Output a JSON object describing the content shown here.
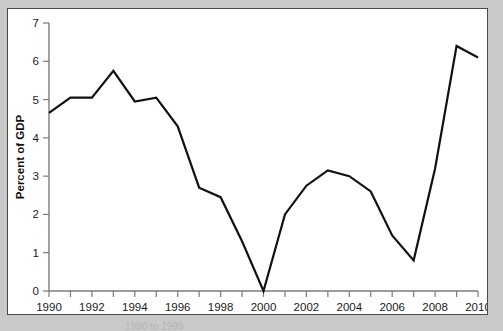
{
  "chart_data": {
    "type": "line",
    "title": "",
    "xlabel": "",
    "ylabel": "Percent of GDP",
    "xlim": [
      1990,
      2010
    ],
    "ylim": [
      0,
      7
    ],
    "grid": false,
    "legend": null,
    "x": [
      1990,
      1991,
      1992,
      1993,
      1994,
      1995,
      1996,
      1997,
      1998,
      1999,
      2000,
      2001,
      2002,
      2003,
      2004,
      2005,
      2006,
      2007,
      2008,
      2009,
      2010
    ],
    "values": [
      4.65,
      5.05,
      5.05,
      5.75,
      4.95,
      5.05,
      4.3,
      2.7,
      2.45,
      1.3,
      0.0,
      2.0,
      2.75,
      3.15,
      3.0,
      2.6,
      1.45,
      0.8,
      3.2,
      6.4,
      6.1
    ],
    "series": [
      {
        "name": "Percent of GDP",
        "color": "#111111",
        "values": [
          4.65,
          5.05,
          5.05,
          5.75,
          4.95,
          5.05,
          4.3,
          2.7,
          2.45,
          1.3,
          0.0,
          2.0,
          2.75,
          3.15,
          3.0,
          2.6,
          1.45,
          0.8,
          3.2,
          6.4,
          6.1
        ]
      }
    ],
    "y_ticks": [
      0,
      1,
      2,
      3,
      4,
      5,
      6,
      7
    ],
    "y_tick_labels": [
      "0",
      "1",
      "2",
      "3",
      "4",
      "5",
      "6",
      "7"
    ],
    "x_ticks": [
      1990,
      1991,
      1992,
      1993,
      1994,
      1995,
      1996,
      1997,
      1998,
      1999,
      2000,
      2001,
      2002,
      2003,
      2004,
      2005,
      2006,
      2007,
      2008,
      2009,
      2010
    ],
    "x_tick_labels_shown": [
      "1990",
      "1992",
      "1994",
      "1996",
      "1998",
      "2000",
      "2002",
      "2004",
      "2006",
      "2008",
      "2010"
    ],
    "x_labelled_ticks": [
      1990,
      1992,
      1994,
      1996,
      1998,
      2000,
      2002,
      2004,
      2006,
      2008,
      2010
    ]
  },
  "figure": {
    "background_color": "#c9c9c9",
    "panel_color": "#ffffff",
    "border_color": "#4a4a4a",
    "line_color": "#111111",
    "axis_color": "#7b7b7b"
  },
  "caption": {
    "text": "1990 to 1999"
  }
}
